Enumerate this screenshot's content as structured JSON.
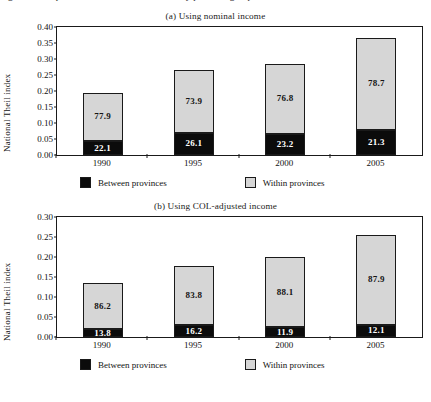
{
  "caption_partial": "Figure   Decomposition of national Theil index by province groups",
  "axis": {
    "ylabel": "National Theil index"
  },
  "legend": {
    "between_label": "Between provinces",
    "within_label": "Within provinces",
    "between_color": "#0b0b0b",
    "within_color": "#d6d6d6"
  },
  "chart_data": [
    {
      "type": "bar",
      "id": "panel-a",
      "title": "(a) Using nominal income",
      "xlabel": "",
      "ylabel": "National Theil index",
      "categories": [
        "1990",
        "1995",
        "2000",
        "2005"
      ],
      "yticks": [
        "0.00",
        "0.05",
        "0.10",
        "0.15",
        "0.20",
        "0.25",
        "0.30",
        "0.35",
        "0.40"
      ],
      "ylim": [
        0,
        0.4
      ],
      "grid": false,
      "legend_position": "bottom",
      "stacked": true,
      "totals": [
        0.195,
        0.265,
        0.285,
        0.367
      ],
      "series": [
        {
          "name": "Between provinces",
          "color": "#0b0b0b",
          "values": [
            0.043,
            0.069,
            0.066,
            0.078
          ],
          "labels": [
            "22.1",
            "26.1",
            "23.2",
            "21.3"
          ]
        },
        {
          "name": "Within provinces",
          "color": "#d6d6d6",
          "values": [
            0.152,
            0.196,
            0.219,
            0.289
          ],
          "labels": [
            "77.9",
            "73.9",
            "76.8",
            "78.7"
          ]
        }
      ]
    },
    {
      "type": "bar",
      "id": "panel-b",
      "title": "(b) Using COL-adjusted income",
      "xlabel": "",
      "ylabel": "National Theil index",
      "categories": [
        "1990",
        "1995",
        "2000",
        "2005"
      ],
      "yticks": [
        "0.00",
        "0.05",
        "0.10",
        "0.15",
        "0.20",
        "0.25",
        "0.30"
      ],
      "ylim": [
        0,
        0.3
      ],
      "grid": false,
      "legend_position": "bottom",
      "stacked": true,
      "totals": [
        0.135,
        0.177,
        0.199,
        0.255
      ],
      "series": [
        {
          "name": "Between provinces",
          "color": "#0b0b0b",
          "values": [
            0.019,
            0.029,
            0.024,
            0.031
          ],
          "labels": [
            "13.8",
            "16.2",
            "11.9",
            "12.1"
          ]
        },
        {
          "name": "Within provinces",
          "color": "#d6d6d6",
          "values": [
            0.116,
            0.148,
            0.175,
            0.224
          ],
          "labels": [
            "86.2",
            "83.8",
            "88.1",
            "87.9"
          ]
        }
      ]
    }
  ]
}
